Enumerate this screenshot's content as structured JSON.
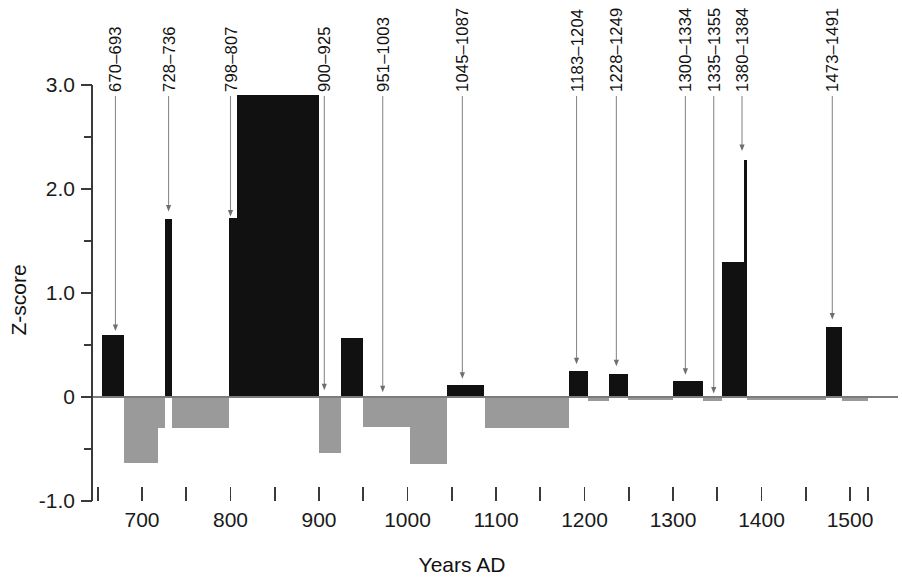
{
  "chart_data": {
    "type": "bar",
    "title": "",
    "subtitle": "",
    "xlabel": "Years AD",
    "ylabel": "Z-score",
    "xlim": [
      650,
      1530
    ],
    "ylim": [
      -1.0,
      3.0
    ],
    "grid": false,
    "legend": null,
    "x_ticks_major": [
      700,
      800,
      900,
      1000,
      1100,
      1200,
      1300,
      1400,
      1500
    ],
    "x_tick_labels": [
      "700",
      "800",
      "900",
      "1000",
      "1100",
      "1200",
      "1300",
      "1400",
      "1500"
    ],
    "x_ticks_minor": [
      650,
      750,
      850,
      950,
      1050,
      1150,
      1250,
      1350,
      1450,
      1520
    ],
    "y_ticks_major": [
      -1.0,
      0,
      1.0,
      2.0,
      3.0
    ],
    "y_tick_labels": [
      "-1.0",
      "0",
      "1.0",
      "2.0",
      "3.0"
    ],
    "y_ticks_minor": [
      -0.5,
      0.5,
      1.5,
      2.5
    ],
    "colors": {
      "positive_bar": "#111111",
      "negative_bar": "#9a9a9a",
      "axis": "#3a3a3a",
      "leader": "#8c8c8c",
      "background": "#ffffff"
    },
    "bars": [
      {
        "name": "seg-0",
        "x_start": 655,
        "x_end": 680,
        "value": 0.6
      },
      {
        "name": "seg-1",
        "x_start": 680,
        "x_end": 718,
        "value": -0.63
      },
      {
        "name": "seg-2",
        "x_start": 718,
        "x_end": 726,
        "value": -0.3
      },
      {
        "name": "seg-3",
        "x_start": 726,
        "x_end": 734,
        "value": 1.71
      },
      {
        "name": "seg-4",
        "x_start": 734,
        "x_end": 798,
        "value": -0.3
      },
      {
        "name": "seg-5",
        "x_start": 798,
        "x_end": 807,
        "value": 1.72
      },
      {
        "name": "seg-6",
        "x_start": 807,
        "x_end": 900,
        "value": 2.9
      },
      {
        "name": "seg-7",
        "x_start": 900,
        "x_end": 925,
        "value": -0.54
      },
      {
        "name": "seg-8",
        "x_start": 925,
        "x_end": 950,
        "value": 0.57
      },
      {
        "name": "seg-9",
        "x_start": 950,
        "x_end": 1003,
        "value": -0.29
      },
      {
        "name": "seg-10",
        "x_start": 1003,
        "x_end": 1045,
        "value": -0.64
      },
      {
        "name": "seg-11",
        "x_start": 1045,
        "x_end": 1087,
        "value": 0.12
      },
      {
        "name": "seg-12",
        "x_start": 1087,
        "x_end": 1183,
        "value": -0.3
      },
      {
        "name": "seg-13",
        "x_start": 1183,
        "x_end": 1204,
        "value": 0.25
      },
      {
        "name": "seg-14",
        "x_start": 1204,
        "x_end": 1228,
        "value": -0.04
      },
      {
        "name": "seg-15",
        "x_start": 1228,
        "x_end": 1249,
        "value": 0.22
      },
      {
        "name": "seg-16",
        "x_start": 1249,
        "x_end": 1300,
        "value": -0.03
      },
      {
        "name": "seg-17",
        "x_start": 1300,
        "x_end": 1334,
        "value": 0.15
      },
      {
        "name": "seg-18",
        "x_start": 1334,
        "x_end": 1355,
        "value": -0.04
      },
      {
        "name": "seg-19",
        "x_start": 1355,
        "x_end": 1380,
        "value": 1.3
      },
      {
        "name": "seg-20",
        "x_start": 1380,
        "x_end": 1384,
        "value": 2.28
      },
      {
        "name": "seg-21",
        "x_start": 1384,
        "x_end": 1473,
        "value": -0.03
      },
      {
        "name": "seg-22",
        "x_start": 1473,
        "x_end": 1491,
        "value": 0.67
      },
      {
        "name": "seg-23",
        "x_start": 1491,
        "x_end": 1520,
        "value": -0.04
      }
    ],
    "annotations": [
      {
        "label": "670–693",
        "x": 670,
        "label_x": 670,
        "y_tip": 0.63,
        "value": 0.6
      },
      {
        "label": "728–736",
        "x": 730,
        "label_x": 730,
        "y_tip": 1.78,
        "value": 1.71
      },
      {
        "label": "798–807",
        "x": 802,
        "label_x": 800,
        "y_tip": 1.73,
        "value": 1.72
      },
      {
        "label": "900–925",
        "x": 906,
        "label_x": 906,
        "y_tip": 0.06,
        "value": -0.54
      },
      {
        "label": "951–1003",
        "x": 977,
        "label_x": 972,
        "y_tip": 0.04,
        "value": -0.29
      },
      {
        "label": "1045–1087",
        "x": 1065,
        "label_x": 1062,
        "y_tip": 0.17,
        "value": 0.12
      },
      {
        "label": "1183–1204",
        "x": 1194,
        "label_x": 1191,
        "y_tip": 0.31,
        "value": 0.25
      },
      {
        "label": "1228–1249",
        "x": 1238,
        "label_x": 1236,
        "y_tip": 0.29,
        "value": 0.22
      },
      {
        "label": "1300–1334",
        "x": 1317,
        "label_x": 1314,
        "y_tip": 0.21,
        "value": 0.15
      },
      {
        "label": "1335–1355",
        "x": 1346,
        "label_x": 1346,
        "y_tip": 0.03,
        "value": -0.04
      },
      {
        "label": "1380–1384",
        "x": 1382,
        "label_x": 1378,
        "y_tip": 2.36,
        "value": 2.28
      },
      {
        "label": "1473–1491",
        "x": 1483,
        "label_x": 1480,
        "y_tip": 0.74,
        "value": 0.67
      }
    ]
  }
}
